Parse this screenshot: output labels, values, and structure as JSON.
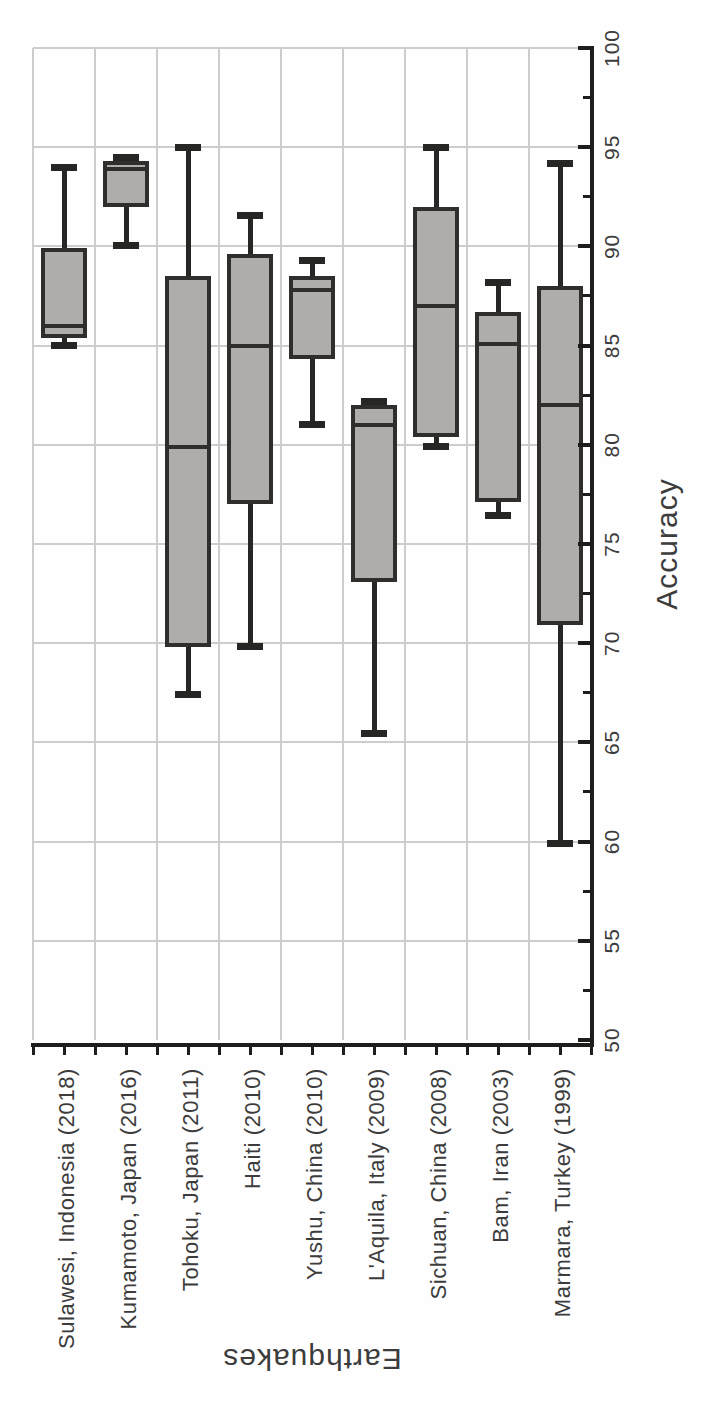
{
  "figure": {
    "colors": {
      "background": "#fefefe",
      "box_fill": "#aeadaa",
      "box_border": "#2f2e2c",
      "whisker": "#262624",
      "grid": "#cdcdcb",
      "axis": "#1d1d1b",
      "text": "#3c3c3c"
    }
  },
  "chart_data": {
    "type": "boxplot",
    "orientation": "horizontal boxes; entire chart rotated 90 degrees counter-clockwise on the page",
    "title": "",
    "value_axis": {
      "label": "Accuracy",
      "min": 50,
      "max": 100,
      "major_tick_step": 5,
      "minor_tick_step": 2.5,
      "ticks": [
        50,
        55,
        60,
        65,
        70,
        75,
        80,
        85,
        90,
        95,
        100
      ]
    },
    "category_axis": {
      "label": "Earthquakes"
    },
    "categories": [
      "Sulawesi, Indonesia (2018)",
      "Kumamoto, Japan (2016)",
      "Tohoku, Japan (2011)",
      "Haiti (2010)",
      "Yushu, China (2010)",
      "L'Aquila, Italy (2009)",
      "Sichuan, China (2008)",
      "Bam, Iran (2003)",
      "Marmara, Turkey (1999)"
    ],
    "series": [
      {
        "name": "Sulawesi, Indonesia (2018)",
        "whisker_low": 85.0,
        "q1": 85.4,
        "median": 86.0,
        "q3": 89.9,
        "whisker_high": 94.0
      },
      {
        "name": "Kumamoto, Japan (2016)",
        "whisker_low": 90.0,
        "q1": 92.0,
        "median": 93.9,
        "q3": 94.3,
        "whisker_high": 94.5
      },
      {
        "name": "Tohoku, Japan (2011)",
        "whisker_low": 67.4,
        "q1": 69.8,
        "median": 79.9,
        "q3": 88.5,
        "whisker_high": 95.0
      },
      {
        "name": "Haiti (2010)",
        "whisker_low": 69.8,
        "q1": 77.0,
        "median": 85.0,
        "q3": 89.6,
        "whisker_high": 91.6
      },
      {
        "name": "Yushu, China (2010)",
        "whisker_low": 81.0,
        "q1": 84.3,
        "median": 87.8,
        "q3": 88.5,
        "whisker_high": 89.3
      },
      {
        "name": "L'Aquila, Italy (2009)",
        "whisker_low": 65.4,
        "q1": 73.1,
        "median": 81.0,
        "q3": 82.0,
        "whisker_high": 82.2
      },
      {
        "name": "Sichuan, China (2008)",
        "whisker_low": 79.9,
        "q1": 80.4,
        "median": 87.0,
        "q3": 92.0,
        "whisker_high": 95.0
      },
      {
        "name": "Bam, Iran (2003)",
        "whisker_low": 76.4,
        "q1": 77.1,
        "median": 85.1,
        "q3": 86.7,
        "whisker_high": 88.2
      },
      {
        "name": "Marmara, Turkey (1999)",
        "whisker_low": 59.9,
        "q1": 70.9,
        "median": 82.0,
        "q3": 88.0,
        "whisker_high": 94.2
      }
    ],
    "grid": true,
    "legend": false
  }
}
